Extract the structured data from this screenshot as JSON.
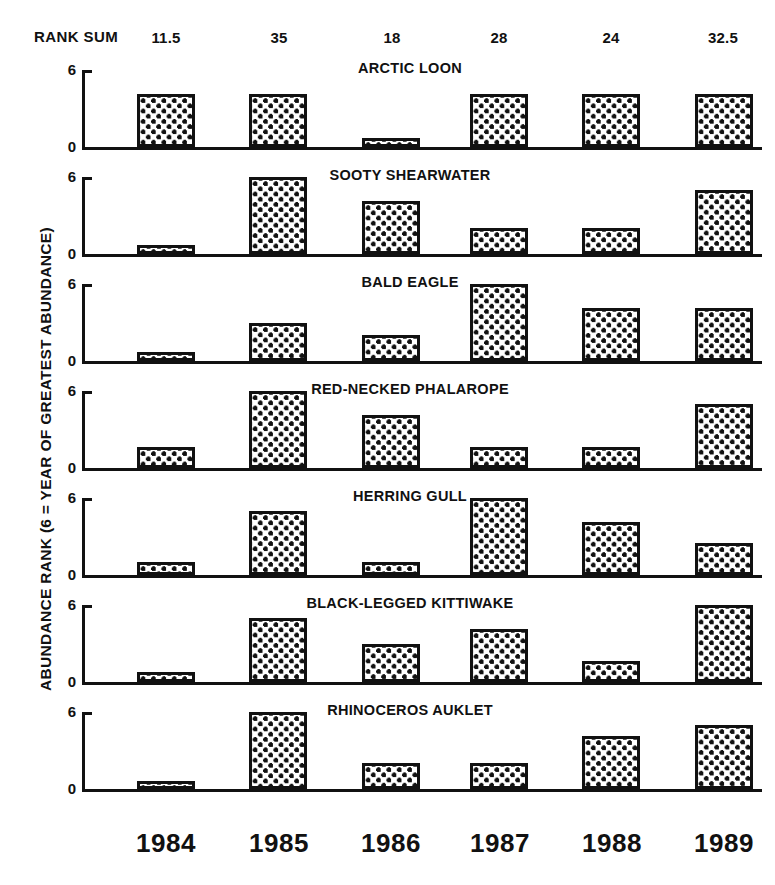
{
  "header": {
    "rank_sum_label": "RANK SUM",
    "rank_sums": [
      "11.5",
      "35",
      "18",
      "28",
      "24",
      "32.5"
    ]
  },
  "axes": {
    "ylabel": "ABUNDANCE RANK (6 = YEAR OF GREATEST ABUNDANCE)",
    "ytick_top": "6",
    "ytick_bottom": "0",
    "years": [
      "1984",
      "1985",
      "1986",
      "1987",
      "1988",
      "1989"
    ]
  },
  "colors": {
    "ink": "#111111",
    "paper": "#ffffff",
    "bar_fill": "#ffffff",
    "bar_dots": "#111111"
  },
  "chart_data": {
    "type": "bar",
    "title": "",
    "xlabel": "",
    "ylabel": "ABUNDANCE RANK (6 = YEAR OF GREATEST ABUNDANCE)",
    "categories": [
      "1984",
      "1985",
      "1986",
      "1987",
      "1988",
      "1989"
    ],
    "ylim": [
      0,
      6
    ],
    "yticks": [
      0,
      6
    ],
    "grid": false,
    "legend": "none",
    "panel_layout": "7 stacked panels, one per species",
    "annotations": {
      "rank_sum_label": "RANK SUM",
      "rank_sum_values": [
        11.5,
        35,
        18,
        28,
        24,
        32.5
      ]
    },
    "series": [
      {
        "name": "ARCTIC LOON",
        "values": [
          4.1,
          4.1,
          0.7,
          4.1,
          4.1,
          4.1
        ]
      },
      {
        "name": "SOOTY SHEARWATER",
        "values": [
          0.7,
          6.0,
          4.1,
          2.0,
          2.0,
          5.0
        ]
      },
      {
        "name": "BALD EAGLE",
        "values": [
          0.7,
          3.0,
          2.0,
          6.0,
          4.1,
          4.1
        ]
      },
      {
        "name": "RED-NECKED PHALAROPE",
        "values": [
          1.6,
          6.0,
          4.1,
          1.6,
          1.6,
          5.0
        ]
      },
      {
        "name": "HERRING GULL",
        "values": [
          1.0,
          5.0,
          1.0,
          6.0,
          4.1,
          2.5
        ]
      },
      {
        "name": "BLACK-LEGGED KITTIWAKE",
        "values": [
          0.8,
          5.0,
          3.0,
          4.1,
          1.6,
          6.0
        ]
      },
      {
        "name": "RHINOCEROS AUKLET",
        "values": [
          0.6,
          6.0,
          2.0,
          2.0,
          4.1,
          5.0
        ]
      }
    ]
  }
}
